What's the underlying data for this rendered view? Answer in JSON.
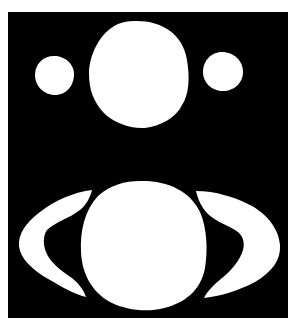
{
  "figure": {
    "background_color": "#000000",
    "shape_color": "#ffffff",
    "page_color": "#ffffff",
    "frame": {
      "x": 8,
      "y": 12,
      "width": 280,
      "height": 306
    },
    "shapes": [
      {
        "name": "top-large-circle",
        "cx": 139,
        "cy": 75,
        "rx": 50,
        "ry": 53
      },
      {
        "name": "top-left-small-circle",
        "cx": 55,
        "cy": 75,
        "rx": 20,
        "ry": 20
      },
      {
        "name": "top-right-small-circle",
        "cx": 223,
        "cy": 72,
        "rx": 20,
        "ry": 20
      },
      {
        "name": "bottom-large-circle",
        "cx": 144,
        "cy": 246,
        "rx": 63,
        "ry": 64
      },
      {
        "name": "left-crescent"
      },
      {
        "name": "right-crescent"
      }
    ]
  }
}
